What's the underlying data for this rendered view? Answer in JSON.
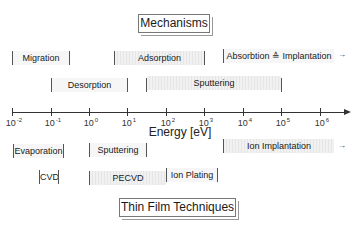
{
  "titles": {
    "top": "Mechanisms",
    "bottom": "Thin Film Techniques"
  },
  "axis": {
    "title": "Energy  [eV]",
    "ticks": [
      {
        "base": "10",
        "exp": "-2"
      },
      {
        "base": "10",
        "exp": "-1"
      },
      {
        "base": "10",
        "exp": "0"
      },
      {
        "base": "10",
        "exp": "1"
      },
      {
        "base": "10",
        "exp": "2"
      },
      {
        "base": "10",
        "exp": "3"
      },
      {
        "base": "10",
        "exp": "4"
      },
      {
        "base": "10",
        "exp": "5"
      },
      {
        "base": "10",
        "exp": "6"
      }
    ]
  },
  "mechanisms": {
    "row1": [
      {
        "label": "Migration",
        "range": "10^-2 – 10^-0.5"
      },
      {
        "label": "Adsorption",
        "range": "10^0.7 – 10^3"
      },
      {
        "label": "Absorbtion ≙ Implantation",
        "range": "10^3.5 – >10^6",
        "continues": "→"
      }
    ],
    "row2": [
      {
        "label": "Desorption",
        "range": "10^-1 – 10^1"
      },
      {
        "label": "Sputtering",
        "range": "10^1.5 – 10^5"
      }
    ]
  },
  "techniques": {
    "row1": [
      {
        "label": "Evaporation",
        "range": "10^-2 – 10^-0.6"
      },
      {
        "label": "Sputtering",
        "range": "10^0 – 10^1.5"
      },
      {
        "label": "Ion Implantation",
        "range": "10^3.5 – >10^6",
        "continues": "→"
      }
    ],
    "row2": [
      {
        "label": "CVD",
        "range": "10^-1.3 – 10^-0.8"
      },
      {
        "label": "PECVD",
        "range": "10^0 – 10^2"
      },
      {
        "label": "Ion Plating",
        "range": "10^2 – 10^3.4"
      }
    ]
  }
}
